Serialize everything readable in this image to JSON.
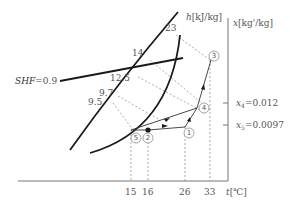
{
  "diagram": {
    "type": "psychrometric-chart",
    "axes": {
      "x_label": "t[℃]",
      "y_label": "x[kg'/kg]",
      "h_label": "h[kJ/kg]",
      "x_ticks": [
        "15",
        "16",
        "26",
        "33"
      ],
      "y_ticks": [
        "x4=0.012",
        "x5=0.0097"
      ]
    },
    "enthalpy_labels": [
      "23",
      "14",
      "12.5",
      "9.7",
      "9.5"
    ],
    "shf_label": "SHF=0.9",
    "points": [
      {
        "id": "1",
        "label": "①"
      },
      {
        "id": "2",
        "label": "②"
      },
      {
        "id": "3",
        "label": "③"
      },
      {
        "id": "4",
        "label": "④"
      },
      {
        "id": "5",
        "label": "⑤"
      }
    ],
    "colors": {
      "line": "#1a1a1a",
      "dashed": "#888888",
      "axis": "#777777",
      "text": "#555555"
    }
  }
}
